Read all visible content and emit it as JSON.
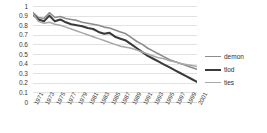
{
  "chart_data": {
    "type": "line",
    "title": "",
    "xlabel": "",
    "ylabel": "",
    "ylim": [
      0,
      1
    ],
    "ytick_values": [
      0,
      0.1,
      0.2,
      0.3,
      0.4,
      0.5,
      0.6,
      0.7,
      0.8,
      0.9,
      1
    ],
    "ytick_labels": [
      "0",
      "0.1",
      "0.2",
      "0.3",
      "0.4",
      "0.5",
      "0.6",
      "0.7",
      "0.8",
      "0.9",
      "1"
    ],
    "grid": true,
    "legend_position": "right",
    "x": [
      1971,
      1972,
      1973,
      1974,
      1975,
      1976,
      1977,
      1978,
      1979,
      1980,
      1981,
      1982,
      1983,
      1984,
      1985,
      1986,
      1987,
      1988,
      1989,
      1990,
      1991,
      1992,
      1993,
      1994,
      1995,
      1996,
      1997,
      1998,
      1999,
      2000,
      2001
    ],
    "xtick_labels": [
      "1971",
      "1973",
      "1975",
      "1977",
      "1979",
      "1981",
      "1983",
      "1985",
      "1987",
      "1989",
      "1991",
      "1993",
      "1995",
      "1997",
      "1999",
      "2001"
    ],
    "series": [
      {
        "name": "demon",
        "color": "#8c8c8c",
        "width": 1.6,
        "values": [
          0.93,
          0.88,
          0.87,
          0.93,
          0.88,
          0.89,
          0.87,
          0.86,
          0.85,
          0.83,
          0.82,
          0.81,
          0.8,
          0.78,
          0.77,
          0.75,
          0.73,
          0.71,
          0.67,
          0.63,
          0.6,
          0.56,
          0.53,
          0.5,
          0.47,
          0.44,
          0.42,
          0.4,
          0.38,
          0.36,
          0.34
        ]
      },
      {
        "name": "tlod",
        "color": "#3a3a3a",
        "width": 2.1,
        "values": [
          0.91,
          0.86,
          0.84,
          0.9,
          0.84,
          0.86,
          0.83,
          0.81,
          0.8,
          0.79,
          0.77,
          0.76,
          0.73,
          0.71,
          0.72,
          0.68,
          0.66,
          0.64,
          0.6,
          0.56,
          0.52,
          0.48,
          0.45,
          0.42,
          0.39,
          0.36,
          0.33,
          0.3,
          0.27,
          0.24,
          0.21
        ]
      },
      {
        "name": "ties",
        "color": "#a8a8a8",
        "width": 1.5,
        "values": [
          0.92,
          0.84,
          0.82,
          0.83,
          0.81,
          0.8,
          0.78,
          0.76,
          0.74,
          0.72,
          0.7,
          0.68,
          0.66,
          0.64,
          0.62,
          0.6,
          0.58,
          0.57,
          0.56,
          0.54,
          0.52,
          0.5,
          0.48,
          0.46,
          0.45,
          0.43,
          0.42,
          0.4,
          0.39,
          0.38,
          0.37
        ]
      }
    ]
  }
}
